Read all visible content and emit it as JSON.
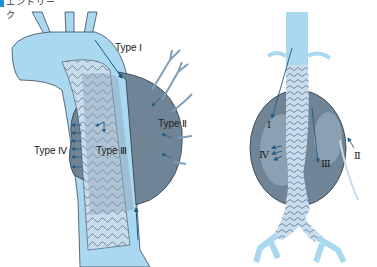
{
  "header": {
    "title": "エンドリーク"
  },
  "left_diagram": {
    "name": "thoracic aortic stent graft endoleak",
    "labels": {
      "type1": "Type Ⅰ",
      "type2": "Type Ⅱ",
      "type3": "Type Ⅲ",
      "type4": "Type Ⅳ"
    }
  },
  "right_diagram": {
    "name": "abdominal aortic stent graft endoleak",
    "labels": {
      "type1": "Ⅰ",
      "type2": "Ⅱ",
      "type3": "Ⅲ",
      "type4": "Ⅳ"
    }
  },
  "colors": {
    "vessel": "#a9d8f0",
    "vessel_outline": "#3a4a5a",
    "sac": "#6f8494",
    "sac_light": "#9eb3c4",
    "graft": "#c9dceb",
    "arrow": "#1c5a8a",
    "accent": "#1f8fd6"
  }
}
